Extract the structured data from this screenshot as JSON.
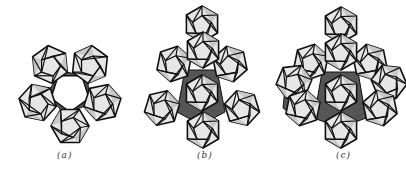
{
  "figure": {
    "panels": [
      {
        "id": "a",
        "label": "(a)",
        "description": "Five icosahedra arranged in a ring around a central pentagonal opening"
      },
      {
        "id": "b",
        "label": "(b)",
        "description": "Icosahedra cluster with additional icosahedra stacked above and below the ring"
      },
      {
        "id": "c",
        "label": "(c)",
        "description": "Larger cluster of interpenetrating icosahedra"
      }
    ],
    "colors": {
      "edge": "#111111",
      "face_light": "#e6e6e6",
      "face_mid": "#c8c8c8",
      "shadow": "#555555",
      "background": "#ffffff"
    }
  }
}
